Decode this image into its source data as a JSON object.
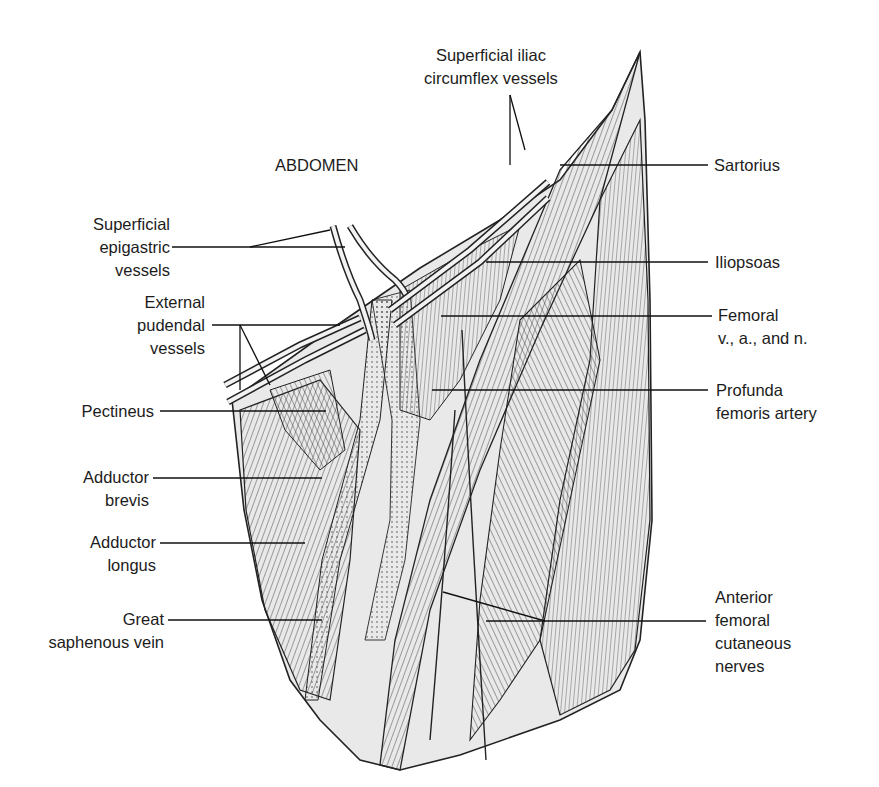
{
  "figure": {
    "region_label": "ABDOMEN",
    "labels": {
      "superficial_iliac": {
        "line1": "Superficial iliac",
        "line2": "circumflex vessels"
      },
      "sartorius": {
        "line1": "Sartorius"
      },
      "iliopsoas": {
        "line1": "Iliopsoas"
      },
      "femoral": {
        "line1": "Femoral",
        "line2": "v., a., and n."
      },
      "profunda": {
        "line1": "Profunda",
        "line2": "femoris artery"
      },
      "anterior_femoral": {
        "line1": "Anterior",
        "line2": "femoral",
        "line3": "cutaneous",
        "line4": "nerves"
      },
      "superficial_epigastric": {
        "line1": "Superficial",
        "line2": "epigastric",
        "line3": "vessels"
      },
      "external_pudendal": {
        "line1": "External",
        "line2": "pudendal",
        "line3": "vessels"
      },
      "pectineus": {
        "line1": "Pectineus"
      },
      "adductor_brevis": {
        "line1": "Adductor",
        "line2": "brevis"
      },
      "adductor_longus": {
        "line1": "Adductor",
        "line2": "longus"
      },
      "great_saphenous": {
        "line1": "Great",
        "line2": "saphenous vein"
      }
    },
    "colors": {
      "ink": "#1a1a1a",
      "muscle_fill": "#e6e6e6",
      "vessel_fill": "#f2f2f2",
      "background": "#ffffff"
    }
  }
}
